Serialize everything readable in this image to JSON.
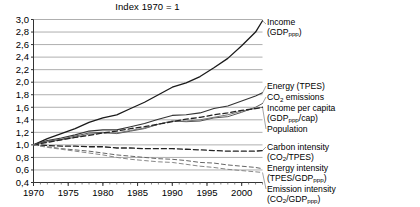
{
  "chart_data": {
    "type": "line",
    "title": "Index 1970 = 1",
    "xlabel": "",
    "ylabel": "",
    "grid": true,
    "legend_position": "right-inline",
    "xlim": [
      1970,
      2003
    ],
    "ylim": [
      0.4,
      3.0
    ],
    "yticks": [
      "0,4",
      "0,6",
      "0,8",
      "1,0",
      "1,2",
      "1,4",
      "1,6",
      "1,8",
      "2,0",
      "2,2",
      "2,4",
      "2,6",
      "2,8",
      "3,0"
    ],
    "ytick_values": [
      0.4,
      0.6,
      0.8,
      1.0,
      1.2,
      1.4,
      1.6,
      1.8,
      2.0,
      2.2,
      2.4,
      2.6,
      2.8,
      3.0
    ],
    "xticks": [
      "1970",
      "1975",
      "1980",
      "1985",
      "1990",
      "1995",
      "2000"
    ],
    "xtick_values": [
      1970,
      1975,
      1980,
      1985,
      1990,
      1995,
      2000
    ],
    "x": [
      1970,
      1972,
      1974,
      1976,
      1978,
      1980,
      1982,
      1984,
      1986,
      1988,
      1990,
      1992,
      1994,
      1996,
      1998,
      2000,
      2002,
      2003
    ],
    "series": [
      {
        "name": "income",
        "label_line1": "Income",
        "label_line2": "(GDP",
        "label_sub": "ppp",
        "label_tail": ")",
        "style": "solid",
        "width": 1.3,
        "color": "#1a1a1a",
        "values": [
          1.0,
          1.1,
          1.18,
          1.26,
          1.36,
          1.43,
          1.48,
          1.58,
          1.68,
          1.8,
          1.92,
          1.99,
          2.09,
          2.23,
          2.38,
          2.58,
          2.8,
          2.98
        ]
      },
      {
        "name": "energy_tpes",
        "label_line1": "Energy (TPES)",
        "style": "solid",
        "width": 1.1,
        "color": "#333333",
        "values": [
          1.0,
          1.07,
          1.11,
          1.16,
          1.22,
          1.24,
          1.24,
          1.29,
          1.34,
          1.41,
          1.47,
          1.48,
          1.51,
          1.58,
          1.62,
          1.7,
          1.78,
          1.83
        ]
      },
      {
        "name": "co2_emissions",
        "label_line1": "CO",
        "label_sub": "2",
        "label_tail": " emissions",
        "style": "solid",
        "width": 1.0,
        "color": "#555555",
        "values": [
          1.0,
          1.06,
          1.09,
          1.14,
          1.19,
          1.2,
          1.18,
          1.22,
          1.26,
          1.33,
          1.38,
          1.37,
          1.38,
          1.43,
          1.45,
          1.52,
          1.6,
          1.66
        ]
      },
      {
        "name": "income_per_capita",
        "label_line1": "Income per capita",
        "label_line2": "(GDP",
        "label_sub": "ppp",
        "label_tail": "/cap)",
        "style": "solid",
        "width": 1.0,
        "color": "#777777",
        "values": [
          1.0,
          1.05,
          1.08,
          1.12,
          1.17,
          1.19,
          1.19,
          1.23,
          1.27,
          1.33,
          1.38,
          1.38,
          1.4,
          1.44,
          1.48,
          1.54,
          1.58,
          1.6
        ]
      },
      {
        "name": "population",
        "label_line1": "Population",
        "style": "dashed",
        "width": 1.3,
        "color": "#222222",
        "values": [
          1.0,
          1.04,
          1.08,
          1.12,
          1.15,
          1.19,
          1.22,
          1.26,
          1.29,
          1.33,
          1.37,
          1.41,
          1.44,
          1.48,
          1.51,
          1.55,
          1.58,
          1.6
        ]
      },
      {
        "name": "carbon_intensity",
        "label_line1": "Carbon intensity",
        "label_line2": "(CO",
        "label_sub": "2",
        "label_tail": "/TPES)",
        "style": "dashed",
        "width": 1.3,
        "color": "#222222",
        "values": [
          1.0,
          0.99,
          0.98,
          0.98,
          0.97,
          0.97,
          0.95,
          0.95,
          0.94,
          0.94,
          0.94,
          0.93,
          0.92,
          0.91,
          0.9,
          0.9,
          0.9,
          0.91
        ]
      },
      {
        "name": "energy_intensity",
        "label_line1": "Energy intensity",
        "label_line2": "(TPES/GDP",
        "label_sub": "ppp",
        "label_tail": ")",
        "style": "dashed",
        "width": 1.0,
        "color": "#666666",
        "values": [
          1.0,
          0.97,
          0.94,
          0.92,
          0.9,
          0.87,
          0.84,
          0.82,
          0.8,
          0.78,
          0.77,
          0.75,
          0.72,
          0.71,
          0.68,
          0.66,
          0.64,
          0.62
        ]
      },
      {
        "name": "emission_intensity",
        "label_line1": "Emission intensity",
        "label_line2": "(CO",
        "label_sub": "2",
        "label_tail": "/GDP",
        "label_sub2": "ppp",
        "label_tail2": ")",
        "style": "dashed",
        "width": 1.0,
        "color": "#888888",
        "values": [
          1.0,
          0.96,
          0.93,
          0.9,
          0.87,
          0.84,
          0.8,
          0.77,
          0.75,
          0.73,
          0.72,
          0.69,
          0.66,
          0.64,
          0.61,
          0.59,
          0.57,
          0.56
        ]
      }
    ]
  },
  "labels": {
    "income_1": "Income",
    "income_2": "(GDP",
    "income_2b": "ppp",
    "income_2c": ")",
    "energy": "Energy (TPES)",
    "co2_a": "CO",
    "co2_b": "2",
    "co2_c": " emissions",
    "ipc_1": "Income per capita",
    "ipc_2": "(GDP",
    "ipc_2b": "ppp",
    "ipc_2c": "/cap)",
    "population": "Population",
    "carbon_1": "Carbon intensity",
    "carbon_2": "(CO",
    "carbon_2b": "2",
    "carbon_2c": "/TPES)",
    "enint_1": "Energy intensity",
    "enint_2": "(TPES/GDP",
    "enint_2b": "ppp",
    "enint_2c": ")",
    "emint_1": "Emission intensity",
    "emint_2": "(CO",
    "emint_2b": "2",
    "emint_2c": "/GDP",
    "emint_2d": "ppp",
    "emint_2e": ")"
  }
}
